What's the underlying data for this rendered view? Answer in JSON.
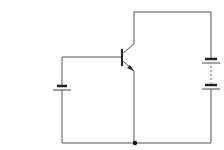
{
  "diagram": {
    "type": "circuit-schematic",
    "components": [
      {
        "id": "Q1",
        "kind": "transistor",
        "variant": "NPN",
        "terminals": [
          "base",
          "collector",
          "emitter"
        ]
      },
      {
        "id": "B1",
        "kind": "battery",
        "cells": 1,
        "position": "left",
        "connects": [
          "base",
          "common"
        ]
      },
      {
        "id": "B2",
        "kind": "battery",
        "cells": "multi (dashed)",
        "position": "right",
        "connects": [
          "collector",
          "common"
        ]
      }
    ],
    "junctions": [
      {
        "id": "J1",
        "position": "bottom-center",
        "connects": [
          "emitter",
          "B1",
          "B2"
        ]
      }
    ],
    "labels": []
  },
  "colors": {
    "wire": "#555555",
    "background": "#ffffff"
  }
}
